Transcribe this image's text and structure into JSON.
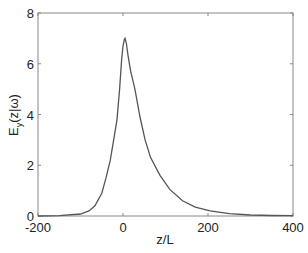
{
  "chart_data": {
    "type": "line",
    "title": "",
    "xlabel": "z/L",
    "ylabel": "E_y(z|ω)",
    "ylabel_parts": {
      "main": "E",
      "sub": "y",
      "rest": "(z|ω)"
    },
    "xlim": [
      -200,
      400
    ],
    "ylim": [
      0,
      8
    ],
    "xticks": [
      -200,
      0,
      200,
      400
    ],
    "yticks": [
      0,
      2,
      4,
      6,
      8
    ],
    "xtick_labels": [
      "-200",
      "0",
      "200",
      "400"
    ],
    "ytick_labels": [
      "0",
      "2",
      "4",
      "6",
      "8"
    ],
    "grid": false,
    "legend": null,
    "series": [
      {
        "name": "E_y",
        "color": "#555555",
        "x": [
          -200,
          -150,
          -100,
          -80,
          -66,
          -50,
          -40,
          -30,
          -20,
          -14,
          -8,
          -3,
          0,
          3,
          5,
          8,
          12,
          18,
          28,
          40,
          52,
          65,
          87,
          110,
          140,
          170,
          205,
          250,
          300,
          350,
          400
        ],
        "y": [
          0,
          0.01,
          0.08,
          0.2,
          0.4,
          0.9,
          1.5,
          2.2,
          3.2,
          3.8,
          5.0,
          6.2,
          6.7,
          6.95,
          7.0,
          6.8,
          6.3,
          5.7,
          5.0,
          3.9,
          3.0,
          2.3,
          1.6,
          1.05,
          0.6,
          0.35,
          0.2,
          0.09,
          0.04,
          0.02,
          0.01
        ]
      }
    ]
  }
}
